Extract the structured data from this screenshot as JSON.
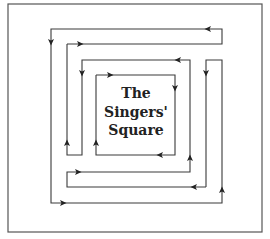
{
  "diagram": {
    "title_lines": [
      "The",
      "Singers'",
      "Square"
    ],
    "colors": {
      "background": "#ffffff",
      "frame": "#555555",
      "lines": "#3a3a3a",
      "arrows": "#222222",
      "text": "#222222"
    },
    "frame": {
      "x": 8,
      "y": 4,
      "width": 254,
      "height": 228
    },
    "inner_square": {
      "x": 96,
      "y": 75,
      "width": 79,
      "height": 80
    },
    "paths": [
      {
        "name": "outer-spiral-top",
        "points": [
          [
            67,
            44
          ],
          [
            222,
            44
          ],
          [
            222,
            29
          ],
          [
            51,
            29
          ],
          [
            51,
            203
          ],
          [
            222,
            203
          ],
          [
            222,
            60
          ],
          [
            206,
            60
          ],
          [
            206,
            187
          ]
        ]
      },
      {
        "name": "middle-spiral",
        "points": [
          [
            206,
            187
          ],
          [
            67,
            187
          ],
          [
            67,
            172
          ],
          [
            190,
            172
          ],
          [
            190,
            60
          ],
          [
            82,
            60
          ],
          [
            82,
            155
          ],
          [
            67,
            155
          ],
          [
            67,
            44
          ]
        ]
      },
      {
        "name": "inner-square-loop",
        "points": [
          [
            96,
            75
          ],
          [
            175,
            75
          ],
          [
            175,
            155
          ],
          [
            96,
            155
          ],
          [
            96,
            75
          ]
        ]
      }
    ],
    "arrows": [
      {
        "x": 208,
        "y": 29,
        "dir": "left"
      },
      {
        "x": 80,
        "y": 44,
        "dir": "right"
      },
      {
        "x": 51,
        "y": 42,
        "dir": "down"
      },
      {
        "x": 63,
        "y": 203,
        "dir": "right"
      },
      {
        "x": 222,
        "y": 190,
        "dir": "up"
      },
      {
        "x": 206,
        "y": 73,
        "dir": "down"
      },
      {
        "x": 194,
        "y": 187,
        "dir": "left"
      },
      {
        "x": 78,
        "y": 172,
        "dir": "right"
      },
      {
        "x": 190,
        "y": 158,
        "dir": "up"
      },
      {
        "x": 178,
        "y": 60,
        "dir": "left"
      },
      {
        "x": 82,
        "y": 73,
        "dir": "down"
      },
      {
        "x": 67,
        "y": 143,
        "dir": "up"
      },
      {
        "x": 110,
        "y": 75,
        "dir": "right"
      },
      {
        "x": 175,
        "y": 88,
        "dir": "down"
      },
      {
        "x": 160,
        "y": 155,
        "dir": "left"
      },
      {
        "x": 96,
        "y": 143,
        "dir": "up"
      }
    ]
  }
}
